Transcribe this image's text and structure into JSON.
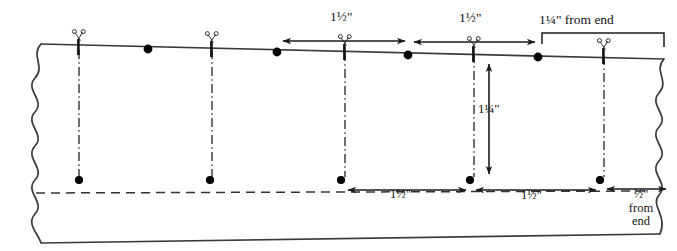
{
  "diagram": {
    "kind": "sewing-measurement-diagram",
    "colors": {
      "line": "#222222",
      "marker": "#000000",
      "dash": "#333333",
      "background": "#ffffff"
    },
    "fabric": {
      "left_edge": "wavy-break",
      "right_edge": "wavy-break",
      "top_edge": "solid",
      "bottom_edge": "solid"
    },
    "top_dimensions": [
      {
        "id": "top-dim-1",
        "label_whole": "1",
        "label_frac": "½",
        "label_unit": "\"",
        "text": "1½\"",
        "x_start": 280,
        "x_end": 408,
        "y": 41,
        "arrow": "both"
      },
      {
        "id": "top-dim-2",
        "label_whole": "1",
        "label_frac": "½",
        "label_unit": "\"",
        "text": "1½\"",
        "x_start": 411,
        "x_end": 538,
        "y": 41,
        "arrow": "both"
      }
    ],
    "top_end_dimension": {
      "id": "top-end-dim",
      "label_whole": "1",
      "label_frac": "¼",
      "label_unit": "\"",
      "suffix": " from end",
      "text": "1¼\" from end",
      "x_start": 541,
      "x_end": 664,
      "y_bracket": 33
    },
    "bottom_dimensions": [
      {
        "id": "bot-dim-1",
        "label_whole": "1",
        "label_frac": "½",
        "label_unit": "\"",
        "text": "1½\"",
        "x_start": 345,
        "x_end": 473,
        "y": 190,
        "arrow": "both"
      },
      {
        "id": "bot-dim-2",
        "label_whole": "1",
        "label_frac": "½",
        "label_unit": "\"",
        "text": "1½\"",
        "x_start": 477,
        "x_end": 604,
        "y": 190,
        "arrow": "both"
      }
    ],
    "bottom_end_dimension": {
      "id": "bot-end-dim",
      "label_frac": "½",
      "label_unit": "\"",
      "line2": "from",
      "line3": "end",
      "text": "½\" from end",
      "x_start": 608,
      "x_end": 668,
      "y": 190
    },
    "vertical_dimension": {
      "id": "vert-dim",
      "label_whole": "1",
      "label_frac": "¼",
      "label_unit": "\"",
      "text": "1¼\"",
      "x": 489,
      "y_start": 62,
      "y_end": 176
    },
    "cut_marks": [
      {
        "id": "cut-mark-1",
        "x": 79,
        "y": 48,
        "icon": "scissors-icon"
      },
      {
        "id": "cut-mark-2",
        "x": 212,
        "y": 48,
        "icon": "scissors-icon"
      },
      {
        "id": "cut-mark-3",
        "x": 345,
        "y": 48,
        "icon": "scissors-icon"
      },
      {
        "id": "cut-mark-4",
        "x": 474,
        "y": 49,
        "icon": "scissors-icon"
      },
      {
        "id": "cut-mark-5",
        "x": 604,
        "y": 50,
        "icon": "scissors-icon"
      }
    ],
    "edge_dots": [
      {
        "id": "edge-dot-1",
        "x": 148,
        "y": 49
      },
      {
        "id": "edge-dot-2",
        "x": 277,
        "y": 51
      },
      {
        "id": "edge-dot-3",
        "x": 408,
        "y": 54
      },
      {
        "id": "edge-dot-4",
        "x": 538,
        "y": 56
      }
    ],
    "drop_lines": [
      {
        "id": "drop-line-1",
        "x": 79,
        "y_start": 50,
        "y_end": 178,
        "style": "dash-dot",
        "end_dot": true
      },
      {
        "id": "drop-line-2",
        "x": 212,
        "y_start": 50,
        "y_end": 178,
        "style": "dash-dot",
        "end_dot": true
      },
      {
        "id": "drop-line-3",
        "x": 345,
        "y_start": 50,
        "y_end": 178,
        "style": "dash-dot",
        "end_dot": true
      },
      {
        "id": "drop-line-4",
        "x": 474,
        "y_start": 52,
        "y_end": 178,
        "style": "dash-dot",
        "end_dot": true
      },
      {
        "id": "drop-line-5",
        "x": 604,
        "y_start": 54,
        "y_end": 178,
        "style": "dash-dot",
        "end_dot": true
      }
    ],
    "guide_line": {
      "id": "guide-line",
      "y_left": 193,
      "y_right": 191,
      "x_start": 36,
      "x_end": 650,
      "style": "dashed"
    }
  }
}
